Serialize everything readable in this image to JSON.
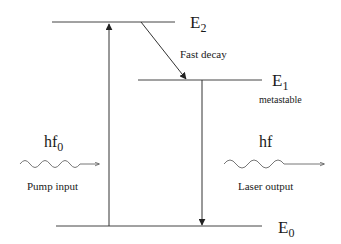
{
  "diagram": {
    "type": "energy-level-diagram",
    "levels": [
      {
        "id": "E2",
        "label": "E",
        "subscript": "2",
        "note": ""
      },
      {
        "id": "E1",
        "label": "E",
        "subscript": "1",
        "note": "metastable"
      },
      {
        "id": "E0",
        "label": "E",
        "subscript": "0",
        "note": ""
      }
    ],
    "transitions": [
      {
        "from": "E0",
        "to": "E2",
        "label": "pump"
      },
      {
        "from": "E2",
        "to": "E1",
        "label": "Fast decay"
      },
      {
        "from": "E1",
        "to": "E0",
        "label": "laser"
      }
    ],
    "pump": {
      "photon_label": "hf",
      "photon_subscript": "0",
      "caption": "Pump input"
    },
    "laser": {
      "photon_label": "hf",
      "caption": "Laser output"
    },
    "colors": {
      "line": "#333333",
      "text": "#1a1a1a",
      "background": "#ffffff"
    }
  }
}
